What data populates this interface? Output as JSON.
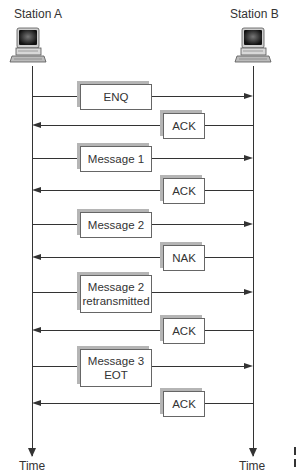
{
  "stations": {
    "a": {
      "label": "Station A",
      "time_label": "Time",
      "icon": "computer-icon"
    },
    "b": {
      "label": "Station B",
      "time_label": "Time",
      "icon": "computer-icon"
    }
  },
  "exchanges": [
    {
      "label": "ENQ",
      "direction": "A_to_B"
    },
    {
      "label": "ACK",
      "direction": "B_to_A"
    },
    {
      "label": "Message 1",
      "direction": "A_to_B"
    },
    {
      "label": "ACK",
      "direction": "B_to_A"
    },
    {
      "label": "Message 2",
      "direction": "A_to_B"
    },
    {
      "label": "NAK",
      "direction": "B_to_A"
    },
    {
      "label": "Message 2 retransmitted",
      "line1": "Message 2",
      "line2": "retransmitted",
      "direction": "A_to_B"
    },
    {
      "label": "ACK",
      "direction": "B_to_A"
    },
    {
      "label": "Message 3 EOT",
      "line1": "Message 3",
      "line2": "EOT",
      "direction": "A_to_B"
    },
    {
      "label": "ACK",
      "direction": "B_to_A"
    }
  ],
  "colors": {
    "line": "#333333",
    "box_border": "#666666",
    "box_shadow": "#b5b5b5"
  }
}
